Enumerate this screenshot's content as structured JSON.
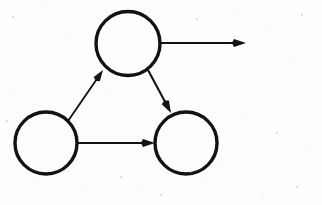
{
  "canvas": {
    "width": 322,
    "height": 205,
    "background_color": "#fdfdfc",
    "ink_color": "#141414",
    "description": "Hand-drawn style directed graph: three open circles connected by arrows, with one arrow leaving the top node to the right"
  },
  "diagram": {
    "type": "directed-graph",
    "node_count": 3,
    "edge_count": 4,
    "stroke_width": 3,
    "edge_stroke_width": 2,
    "nodes": [
      {
        "id": "top",
        "name": "top-node",
        "label": "",
        "cx": 128,
        "cy": 43.5,
        "r": 32,
        "stroke_width": 3.4,
        "fill": "none",
        "stroke": "#121212"
      },
      {
        "id": "bottom-left",
        "name": "bottom-left-node",
        "label": "",
        "cx": 46,
        "cy": 143,
        "r": 31,
        "stroke_width": 3.4,
        "fill": "none",
        "stroke": "#121212"
      },
      {
        "id": "bottom-right",
        "name": "bottom-right-node",
        "label": "",
        "cx": 186,
        "cy": 143,
        "r": 31,
        "stroke_width": 3.4,
        "fill": "none",
        "stroke": "#121212"
      }
    ],
    "edges": [
      {
        "id": "edge-bl-to-top",
        "name": "edge-bottom-left-to-top",
        "from": "bottom-left",
        "to": "top",
        "label": "",
        "x1": 68,
        "y1": 121,
        "x2": 103,
        "y2": 70,
        "arrow": "end",
        "arrow_size": 11,
        "stroke_width": 1.9
      },
      {
        "id": "edge-top-to-br",
        "name": "edge-top-to-bottom-right",
        "from": "top",
        "to": "bottom-right",
        "label": "",
        "x1": 148,
        "y1": 70,
        "x2": 171,
        "y2": 113,
        "arrow": "end",
        "arrow_size": 12,
        "stroke_width": 2.1
      },
      {
        "id": "edge-bl-to-br",
        "name": "edge-bottom-left-to-bottom-right",
        "from": "bottom-left",
        "to": "bottom-right",
        "label": "",
        "x1": 78,
        "y1": 143,
        "x2": 155,
        "y2": 143,
        "arrow": "end",
        "arrow_size": 12,
        "stroke_width": 2.1
      },
      {
        "id": "edge-top-outgoing",
        "name": "edge-top-outgoing",
        "from": "top",
        "to": "",
        "label": "",
        "x1": 160,
        "y1": 43,
        "x2": 246,
        "y2": 43,
        "arrow": "end",
        "arrow_size": 12,
        "stroke_width": 2.1
      }
    ]
  },
  "texture": {
    "speckle_color": "#cfcfcb",
    "specks": [
      {
        "x": 12,
        "y": 16,
        "s": 2
      },
      {
        "x": 47,
        "y": 7,
        "s": 1
      },
      {
        "x": 71,
        "y": 32,
        "s": 1
      },
      {
        "x": 196,
        "y": 18,
        "s": 2
      },
      {
        "x": 232,
        "y": 9,
        "s": 1
      },
      {
        "x": 268,
        "y": 27,
        "s": 1
      },
      {
        "x": 301,
        "y": 14,
        "s": 2
      },
      {
        "x": 288,
        "y": 62,
        "s": 1
      },
      {
        "x": 252,
        "y": 78,
        "s": 1
      },
      {
        "x": 105,
        "y": 95,
        "s": 1
      },
      {
        "x": 14,
        "y": 88,
        "s": 1
      },
      {
        "x": 6,
        "y": 120,
        "s": 2
      },
      {
        "x": 241,
        "y": 113,
        "s": 1
      },
      {
        "x": 276,
        "y": 132,
        "s": 2
      },
      {
        "x": 309,
        "y": 151,
        "s": 1
      },
      {
        "x": 222,
        "y": 160,
        "s": 1
      },
      {
        "x": 120,
        "y": 176,
        "s": 2
      },
      {
        "x": 86,
        "y": 190,
        "s": 1
      },
      {
        "x": 38,
        "y": 183,
        "s": 1
      },
      {
        "x": 160,
        "y": 194,
        "s": 2
      },
      {
        "x": 205,
        "y": 181,
        "s": 1
      },
      {
        "x": 263,
        "y": 196,
        "s": 1
      },
      {
        "x": 296,
        "y": 186,
        "s": 2
      },
      {
        "x": 143,
        "y": 186,
        "s": 1
      },
      {
        "x": 20,
        "y": 198,
        "s": 1
      },
      {
        "x": 190,
        "y": 172,
        "s": 1
      }
    ]
  }
}
